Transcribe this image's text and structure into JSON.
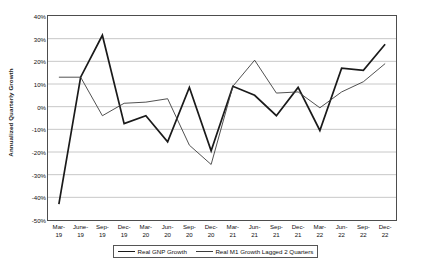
{
  "chart_data": {
    "type": "line",
    "title": "",
    "xlabel": "",
    "ylabel": "Annualized Quarterly Growth",
    "ylim": [
      -50,
      40
    ],
    "ytick_step": 10,
    "grid": true,
    "legend_position": "bottom",
    "x_tick_labels": [
      {
        "line1": "Mar-",
        "line2": "19"
      },
      {
        "line1": "June-",
        "line2": "19"
      },
      {
        "line1": "Sep-",
        "line2": "19"
      },
      {
        "line1": "Dec-",
        "line2": "19"
      },
      {
        "line1": "Mar-",
        "line2": "20"
      },
      {
        "line1": "Jun-",
        "line2": "20"
      },
      {
        "line1": "Sep-",
        "line2": "20"
      },
      {
        "line1": "Dec-",
        "line2": "20"
      },
      {
        "line1": "Mar-",
        "line2": "21"
      },
      {
        "line1": "Jun-",
        "line2": "21"
      },
      {
        "line1": "Sep-",
        "line2": "21"
      },
      {
        "line1": "Dec-",
        "line2": "21"
      },
      {
        "line1": "Mar-",
        "line2": "22"
      },
      {
        "line1": "Jun-",
        "line2": "22"
      },
      {
        "line1": "Sep-",
        "line2": "22"
      },
      {
        "line1": "Dec-",
        "line2": "22"
      }
    ],
    "y_tick_labels": [
      "40%",
      "30%",
      "20%",
      "10%",
      "0%",
      "-10%",
      "-20%",
      "-30%",
      "-40%",
      "-50%"
    ],
    "categories": [
      "Mar-19",
      "June-19",
      "Sep-19",
      "Dec-19",
      "Mar-20",
      "Jun-20",
      "Sep-20",
      "Dec-20",
      "Mar-21",
      "Jun-21",
      "Sep-21",
      "Dec-21",
      "Mar-22",
      "Jun-22",
      "Sep-22",
      "Dec-22"
    ],
    "series": [
      {
        "name": "Real GNP Growth",
        "color": "#1a1a1a",
        "width": 1.7,
        "values": [
          -43,
          13,
          31.5,
          -7.5,
          -4,
          -15.5,
          8.5,
          -19.5,
          9,
          5,
          -4,
          8.5,
          -10.5,
          17,
          16,
          27.5
        ]
      },
      {
        "name": "Real M1 Growth Lagged 2 Quarters",
        "color": "#3d3d3d",
        "width": 0.9,
        "values": [
          13,
          13,
          -4,
          1.5,
          2,
          3.5,
          -17,
          -25.5,
          9,
          20.5,
          6,
          6.5,
          -0.5,
          6.5,
          11,
          19
        ]
      }
    ]
  },
  "legend": {
    "entries": [
      {
        "label": "Real GNP Growth",
        "style": "thick"
      },
      {
        "label": "Real M1 Growth Lagged 2 Quarters",
        "style": "thin"
      }
    ]
  }
}
